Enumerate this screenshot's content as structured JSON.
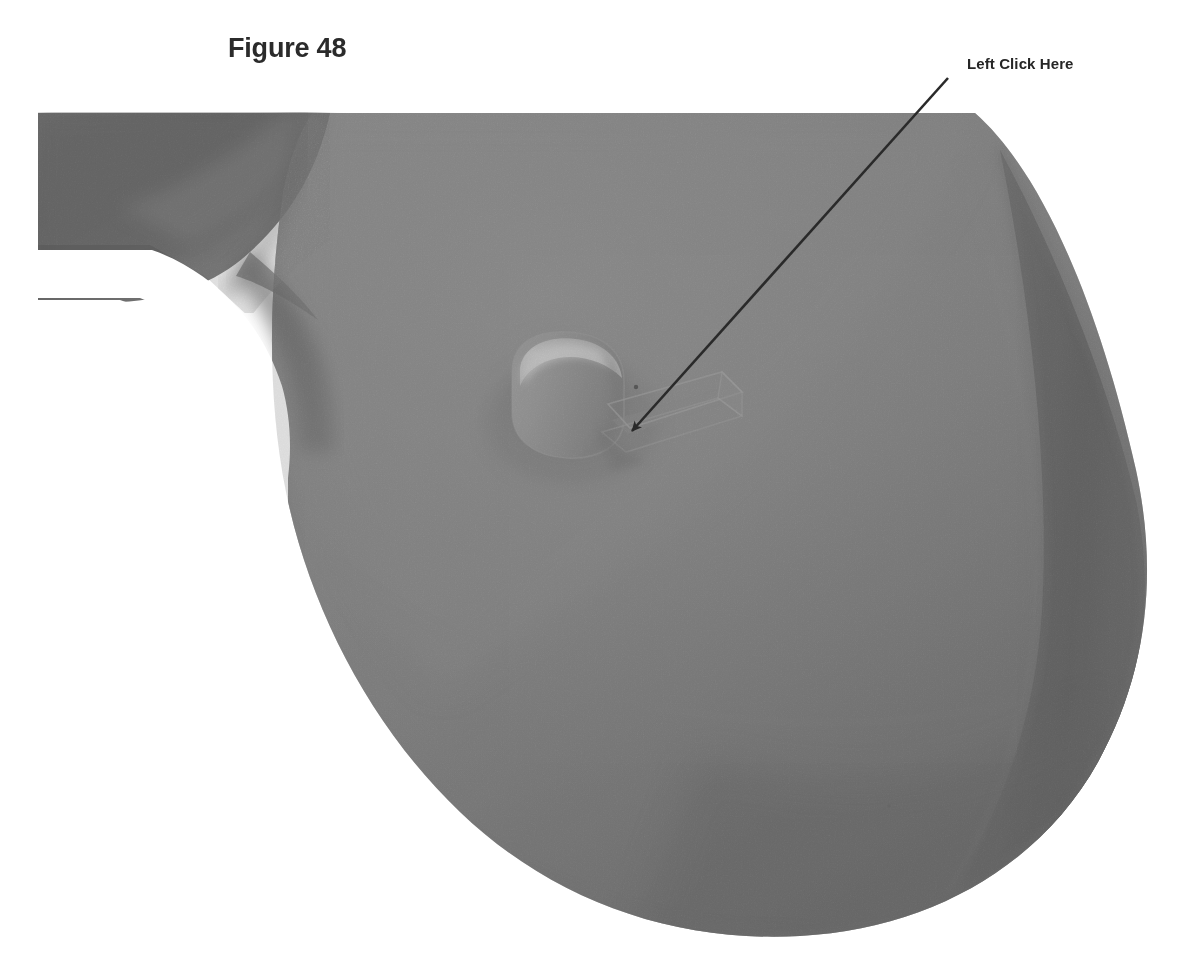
{
  "page": {
    "background_color": "#ffffff",
    "width": 1177,
    "height": 971
  },
  "top_remnant": {
    "text": "............",
    "note": "faint clipped text row at very top edge"
  },
  "figure": {
    "title": "Figure 48",
    "title_color": "#2b2b2b"
  },
  "callout": {
    "label": "Left Click Here",
    "label_color": "#262626",
    "arrow_color": "#2a2a2a",
    "arrow_start_x": 948,
    "arrow_start_y": 78,
    "arrow_tip_x": 624,
    "arrow_tip_y": 440
  },
  "model": {
    "type": "3d-cad-view",
    "description": "Shaded gray CAD model of a large circular disc / impeller face with a tapered shaft entering from upper-left and a small cylindrical boss with a rectangular keyway slot near the center",
    "colors": {
      "disc_base": "#7d7d7d",
      "disc_light": "#8a8a8a",
      "disc_mid": "#777777",
      "disc_dark": "#5c5c5c",
      "disc_darkest": "#4f4f4f",
      "shaft_dark": "#5e5e5e",
      "shaft_mid": "#6f6f6f",
      "boss_body": "#8d8d8d",
      "boss_highlight": "#c6c6c6",
      "boss_shadow": "#6a6a6a",
      "slot_edge": "#9a9a9a",
      "background": "#ffffff"
    },
    "features": [
      {
        "name": "tapered-shaft",
        "position": "upper-left"
      },
      {
        "name": "disc-face",
        "position": "center"
      },
      {
        "name": "center-boss-cylinder",
        "position": "center",
        "cx": 567,
        "cy": 392
      },
      {
        "name": "keyway-slot",
        "position": "right-of-boss"
      },
      {
        "name": "disc-rim-band",
        "position": "right-edge"
      }
    ]
  }
}
